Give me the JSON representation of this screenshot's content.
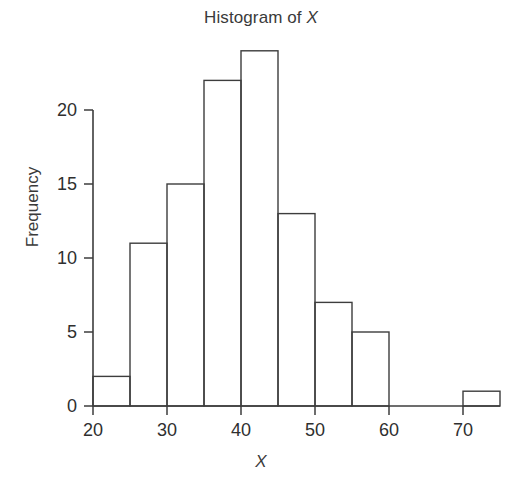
{
  "chart_data": {
    "type": "bar",
    "title": "Histogram of X",
    "title_parts": {
      "prefix": "Histogram of ",
      "variable": "X"
    },
    "xlabel": "X",
    "ylabel": "Frequency",
    "bin_width": 5,
    "bin_edges": [
      20,
      25,
      30,
      35,
      40,
      45,
      50,
      55,
      60,
      65,
      70,
      75
    ],
    "categories": [
      "20-25",
      "25-30",
      "30-35",
      "35-40",
      "40-45",
      "45-50",
      "50-55",
      "55-60",
      "60-65",
      "65-70",
      "70-75"
    ],
    "values": [
      2,
      11,
      15,
      22,
      24,
      13,
      7,
      5,
      0,
      0,
      1
    ],
    "xlim": [
      20,
      75
    ],
    "ylim": [
      0,
      24
    ],
    "x_ticks": [
      20,
      30,
      40,
      50,
      60,
      70
    ],
    "x_tick_labels": [
      "20",
      "30",
      "40",
      "50",
      "60",
      "70"
    ],
    "x_minor_ticks": [
      25,
      35,
      45,
      55,
      65,
      75
    ],
    "y_ticks": [
      0,
      5,
      10,
      15,
      20
    ],
    "y_tick_labels": [
      "0",
      "5",
      "10",
      "15",
      "20"
    ],
    "grid": false,
    "legend": false,
    "bar_fill": "none",
    "bar_stroke": "#3d3d3d",
    "background": "#ffffff",
    "text_color": "#2f2f2f"
  }
}
